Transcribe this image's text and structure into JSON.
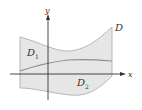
{
  "diagram": {
    "region_label": "D",
    "subregions": [
      {
        "label": "D",
        "subscript": "1"
      },
      {
        "label": "D",
        "subscript": "2"
      }
    ],
    "axes": {
      "x_label": "x",
      "y_label": "y"
    },
    "colors": {
      "region_fill": "#e6e6e6",
      "region_edge": "#9a9a9a",
      "divider": "#8c8c8c",
      "axis": "#333333"
    }
  }
}
